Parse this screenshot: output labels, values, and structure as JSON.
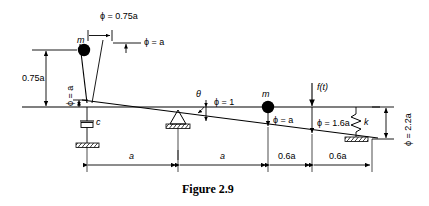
{
  "figure": {
    "caption": "Figure 2.9",
    "type": "engineering-schematic"
  },
  "labels": {
    "phi_top": "ϕ = 0.75a",
    "phi_mast_tip": "ϕ = a",
    "dim_left_vertical": "0.75a",
    "phi_left_vertical": "ϕ = a",
    "damper": "c",
    "theta": "θ",
    "phi_pivot": "ϕ = 1",
    "mass_left": "m",
    "mass_right": "m",
    "phi_mass_right": "ϕ = a",
    "force": "f(t)",
    "phi_force": "ϕ = 1.6a",
    "spring": "k",
    "phi_spring_vertical": "ϕ = 2.2a"
  },
  "dimensions": {
    "items": [
      {
        "label": "a"
      },
      {
        "label": "a"
      },
      {
        "label": "0.6a"
      },
      {
        "label": "0.6a"
      }
    ]
  },
  "colors": {
    "ink": "#000000",
    "background": "#ffffff"
  }
}
